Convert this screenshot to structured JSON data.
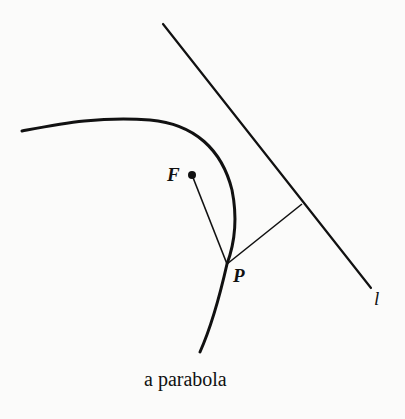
{
  "diagram": {
    "caption": "a parabola",
    "labels": {
      "focus": "F",
      "point": "P",
      "directrix": "l"
    },
    "colors": {
      "ink": "#111111",
      "background": "#fbfbfa"
    },
    "elements": [
      {
        "name": "parabola-curve",
        "type": "curve"
      },
      {
        "name": "directrix-line",
        "type": "line",
        "label": "l"
      },
      {
        "name": "focus-point",
        "type": "point",
        "label": "F"
      },
      {
        "name": "point-on-curve",
        "type": "point",
        "label": "P"
      },
      {
        "name": "segment-FP",
        "type": "segment"
      },
      {
        "name": "perpendicular-P-to-l",
        "type": "segment"
      }
    ]
  }
}
